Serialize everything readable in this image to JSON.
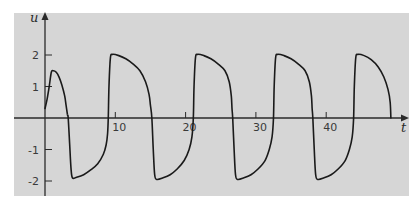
{
  "chart_data": {
    "type": "line",
    "title": "",
    "xlabel": "t",
    "ylabel": "u",
    "xlim": [
      0,
      51
    ],
    "ylim": [
      -2.6,
      3.0
    ],
    "grid": false,
    "legend": "none",
    "x_ticks": [
      10,
      20,
      30,
      40
    ],
    "x_tick_labels": [
      "10",
      "20",
      "30",
      "40"
    ],
    "y_ticks": [
      2,
      1,
      -1,
      -2
    ],
    "y_tick_labels": [
      "2",
      "1",
      "-1",
      "-2"
    ],
    "series": [
      {
        "name": "u(t)",
        "color": "#1a1a1a",
        "points": [
          [
            0.0,
            0.3
          ],
          [
            0.3,
            0.6
          ],
          [
            0.6,
            1.0
          ],
          [
            0.9,
            1.45
          ],
          [
            1.2,
            1.5
          ],
          [
            1.6,
            1.45
          ],
          [
            2.0,
            1.3
          ],
          [
            2.4,
            1.05
          ],
          [
            2.8,
            0.7
          ],
          [
            3.0,
            0.4
          ],
          [
            3.2,
            0.1
          ],
          [
            3.3,
            0.0
          ],
          [
            3.5,
            -0.8
          ],
          [
            3.7,
            -1.6
          ],
          [
            3.9,
            -1.9
          ],
          [
            4.5,
            -1.88
          ],
          [
            5.5,
            -1.8
          ],
          [
            6.5,
            -1.65
          ],
          [
            7.5,
            -1.45
          ],
          [
            8.3,
            -1.15
          ],
          [
            8.7,
            -0.85
          ],
          [
            8.9,
            -0.5
          ],
          [
            9.0,
            0.0
          ],
          [
            9.1,
            1.0
          ],
          [
            9.3,
            1.9
          ],
          [
            9.6,
            2.02
          ],
          [
            10.5,
            1.98
          ],
          [
            11.5,
            1.88
          ],
          [
            12.5,
            1.72
          ],
          [
            13.5,
            1.5
          ],
          [
            14.3,
            1.15
          ],
          [
            14.8,
            0.75
          ],
          [
            15.0,
            0.4
          ],
          [
            15.2,
            0.0
          ],
          [
            15.4,
            -1.0
          ],
          [
            15.6,
            -1.8
          ],
          [
            15.9,
            -1.95
          ],
          [
            16.8,
            -1.9
          ],
          [
            17.8,
            -1.8
          ],
          [
            18.8,
            -1.62
          ],
          [
            19.8,
            -1.35
          ],
          [
            20.5,
            -1.0
          ],
          [
            20.9,
            -0.6
          ],
          [
            21.1,
            0.0
          ],
          [
            21.2,
            1.0
          ],
          [
            21.4,
            1.9
          ],
          [
            21.7,
            2.02
          ],
          [
            22.6,
            1.98
          ],
          [
            23.6,
            1.88
          ],
          [
            24.6,
            1.72
          ],
          [
            25.6,
            1.5
          ],
          [
            26.2,
            1.15
          ],
          [
            26.5,
            0.7
          ],
          [
            26.6,
            0.3
          ],
          [
            26.7,
            0.0
          ],
          [
            26.9,
            -1.0
          ],
          [
            27.1,
            -1.8
          ],
          [
            27.4,
            -1.95
          ],
          [
            28.3,
            -1.9
          ],
          [
            29.3,
            -1.8
          ],
          [
            30.3,
            -1.62
          ],
          [
            31.3,
            -1.35
          ],
          [
            31.9,
            -1.0
          ],
          [
            32.3,
            -0.6
          ],
          [
            32.5,
            0.0
          ],
          [
            32.6,
            1.0
          ],
          [
            32.8,
            1.9
          ],
          [
            33.1,
            2.02
          ],
          [
            34.0,
            1.98
          ],
          [
            35.0,
            1.88
          ],
          [
            36.0,
            1.72
          ],
          [
            37.0,
            1.5
          ],
          [
            37.6,
            1.15
          ],
          [
            37.9,
            0.7
          ],
          [
            38.0,
            0.3
          ],
          [
            38.1,
            0.0
          ],
          [
            38.3,
            -1.0
          ],
          [
            38.5,
            -1.8
          ],
          [
            38.8,
            -1.95
          ],
          [
            39.7,
            -1.9
          ],
          [
            40.7,
            -1.8
          ],
          [
            41.7,
            -1.62
          ],
          [
            42.7,
            -1.35
          ],
          [
            43.3,
            -1.0
          ],
          [
            43.7,
            -0.6
          ],
          [
            43.9,
            0.0
          ],
          [
            44.0,
            1.0
          ],
          [
            44.2,
            1.9
          ],
          [
            44.5,
            2.02
          ],
          [
            45.4,
            1.98
          ],
          [
            46.4,
            1.85
          ],
          [
            47.4,
            1.62
          ],
          [
            48.2,
            1.3
          ],
          [
            48.8,
            0.9
          ],
          [
            49.1,
            0.5
          ],
          [
            49.2,
            0.0
          ]
        ]
      }
    ]
  }
}
